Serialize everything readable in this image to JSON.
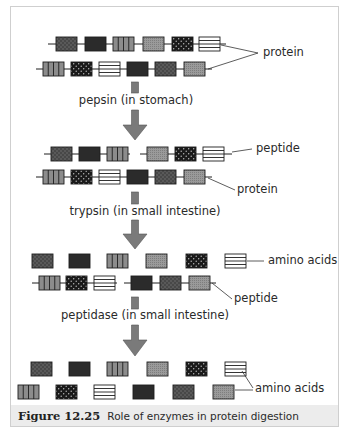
{
  "figure": {
    "number": "Figure 12.25",
    "caption": "Role of enzymes in protein digestion",
    "colors": {
      "frame": "#cfcfcf",
      "caption_band": "#ececec",
      "arrow_fill": "#7a7a7a",
      "text": "#2a2a2a"
    }
  },
  "block_types": [
    "dark-dotted",
    "solid-dark",
    "vertical-stripes",
    "light-stipple",
    "black-white-dots",
    "horizontal-stripes"
  ],
  "stages": [
    {
      "name": "stage-1",
      "rows": [
        {
          "blocks": [
            "dark-dotted",
            "solid-dark",
            "vertical-stripes",
            "light-stipple",
            "black-white-dots",
            "horizontal-stripes"
          ],
          "connected": true
        },
        {
          "blocks": [
            "vertical-stripes",
            "black-white-dots",
            "horizontal-stripes",
            "solid-dark",
            "dark-dotted",
            "light-stipple"
          ],
          "connected": true
        }
      ],
      "labels": [
        "protein"
      ]
    },
    {
      "name": "stage-2",
      "rows": [
        {
          "blocks": [
            "dark-dotted",
            "solid-dark",
            "vertical-stripes",
            "|",
            "light-stipple",
            "black-white-dots",
            "horizontal-stripes"
          ],
          "connected": true
        },
        {
          "blocks": [
            "vertical-stripes",
            "black-white-dots",
            "horizontal-stripes",
            "solid-dark",
            "dark-dotted",
            "light-stipple"
          ],
          "connected": true
        }
      ],
      "labels": [
        "peptide",
        "protein"
      ]
    },
    {
      "name": "stage-3",
      "rows": [
        {
          "blocks": [
            "dark-dotted",
            "solid-dark",
            "vertical-stripes",
            "light-stipple",
            "black-white-dots",
            "horizontal-stripes"
          ],
          "connected": false
        },
        {
          "blocks": [
            "vertical-stripes",
            "black-white-dots",
            "horizontal-stripes",
            "|",
            "solid-dark",
            "dark-dotted",
            "light-stipple"
          ],
          "connected": true
        }
      ],
      "labels": [
        "amino acids",
        "peptide"
      ]
    },
    {
      "name": "stage-4",
      "rows": [
        {
          "blocks": [
            "dark-dotted",
            "solid-dark",
            "vertical-stripes",
            "light-stipple",
            "black-white-dots",
            "horizontal-stripes"
          ],
          "connected": false
        },
        {
          "blocks": [
            "vertical-stripes",
            "black-white-dots",
            "horizontal-stripes",
            "solid-dark",
            "dark-dotted",
            "light-stipple"
          ],
          "connected": false
        }
      ],
      "labels": [
        "amino acids"
      ]
    }
  ],
  "steps": [
    {
      "enzyme_label": "pepsin (in stomach)"
    },
    {
      "enzyme_label": "trypsin (in small intestine)"
    },
    {
      "enzyme_label": "peptidase (in small intestine)"
    }
  ],
  "labels": {
    "protein_1": "protein",
    "peptide_2": "peptide",
    "protein_2": "protein",
    "amino_acids_3": "amino acids",
    "peptide_3": "peptide",
    "amino_acids_4": "amino acids"
  }
}
